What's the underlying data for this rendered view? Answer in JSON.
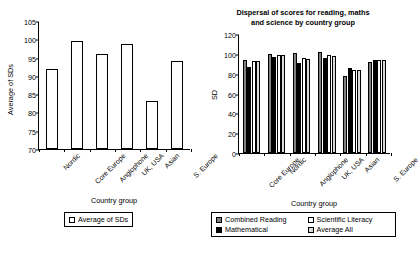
{
  "chart_data": [
    {
      "id": "left",
      "type": "bar",
      "title": "",
      "xlabel": "Country group",
      "ylabel": "Average of SDs",
      "ylim": [
        70,
        105
      ],
      "ytick_step": 5,
      "yticks": [
        70,
        75,
        80,
        85,
        90,
        95,
        100,
        105
      ],
      "grid": false,
      "legend_position": "bottom",
      "categories": [
        "Nordic",
        "Core Europe",
        "Anglophone",
        "UK, USA",
        "Asian",
        "S. Europe"
      ],
      "series": [
        {
          "name": "Average of SDs",
          "color": "#ffffff",
          "values": [
            92.0,
            99.5,
            96.0,
            98.7,
            83.0,
            94.0
          ]
        }
      ]
    },
    {
      "id": "right",
      "type": "bar",
      "title": "Dispersal of scores for reading, maths and science by country group",
      "title_line1": "Dispersal of scores for reading, maths",
      "title_line2": "and science by country group",
      "xlabel": "Country group",
      "ylabel": "SD",
      "ylim": [
        0,
        120
      ],
      "ytick_step": 20,
      "yticks": [
        0,
        20,
        40,
        60,
        80,
        100,
        120
      ],
      "grid": false,
      "legend_position": "bottom",
      "categories": [
        "Core Europe",
        "Nordic",
        "Anglophone",
        "UK, USA",
        "Asian",
        "S. Europe"
      ],
      "series": [
        {
          "name": "Combined Reading",
          "color": "#808080",
          "values": [
            94.0,
            100.0,
            100.5,
            102.0,
            77.5,
            91.5
          ]
        },
        {
          "name": "Mathematical",
          "color": "#000000",
          "values": [
            87.0,
            96.5,
            90.5,
            95.5,
            86.0,
            94.0
          ]
        },
        {
          "name": "Scientific Literacy",
          "color": "#ffffff",
          "values": [
            92.5,
            99.0,
            95.5,
            98.5,
            83.5,
            94.0
          ]
        },
        {
          "name": "Average All",
          "color": "#d9d9d9",
          "values": [
            92.5,
            98.5,
            95.0,
            98.0,
            84.0,
            93.5
          ]
        }
      ]
    }
  ],
  "left_chart": {
    "ylabel": "Average of SDs",
    "xlabel": "Country group",
    "legend": [
      {
        "label": "Average of SDs",
        "color": "#ffffff"
      }
    ]
  },
  "right_chart": {
    "title_line1": "Dispersal of scores for reading, maths",
    "title_line2": "and science by country group",
    "ylabel": "SD",
    "xlabel": "Country group",
    "legend": [
      {
        "label": "Combined Reading",
        "color": "#808080"
      },
      {
        "label": "Scientific Literacy",
        "color": "#ffffff"
      },
      {
        "label": "Mathematical",
        "color": "#000000"
      },
      {
        "label": "Average All",
        "color": "#d9d9d9"
      }
    ]
  }
}
